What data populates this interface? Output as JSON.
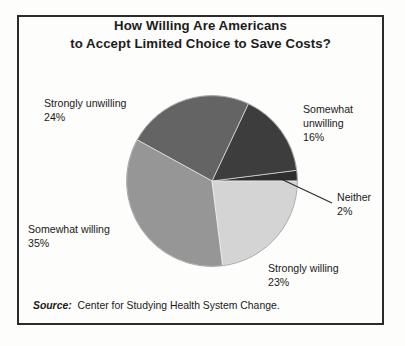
{
  "chart_data": {
    "type": "pie",
    "title": "How Willing Are Americans to Accept Limited Choice to Save Costs?",
    "title_lines": [
      "How Willing Are Americans",
      "to Accept Limited Choice to Save Costs?"
    ],
    "categories": [
      "Neither",
      "Somewhat unwilling",
      "Strongly unwilling",
      "Somewhat willing",
      "Strongly willing"
    ],
    "values": [
      2,
      16,
      24,
      35,
      23
    ],
    "value_labels": [
      "2%",
      "16%",
      "24%",
      "35%",
      "23%"
    ],
    "unit": "%",
    "colors": [
      "#2f2f2f",
      "#3d3d3d",
      "#646464",
      "#969696",
      "#d4d4d4"
    ],
    "legend_position": "callout-labels",
    "grid": false,
    "xlabel": "",
    "ylabel": "",
    "start_angle_deg": 0,
    "direction": "counterclockwise",
    "slices": [
      {
        "name": "Neither",
        "value": 2,
        "label": "Neither",
        "value_label": "2%",
        "color": "#2f2f2f",
        "start_deg": 0.0,
        "end_deg": 7.2
      },
      {
        "name": "Somewhat unwilling",
        "value": 16,
        "label": "Somewhat unwilling",
        "value_label": "16%",
        "color": "#3d3d3d",
        "start_deg": 7.2,
        "end_deg": 64.8
      },
      {
        "name": "Strongly unwilling",
        "value": 24,
        "label": "Strongly unwilling",
        "value_label": "24%",
        "color": "#646464",
        "start_deg": 64.8,
        "end_deg": 151.2
      },
      {
        "name": "Somewhat willing",
        "value": 35,
        "label": "Somewhat willing",
        "value_label": "35%",
        "color": "#969696",
        "start_deg": 151.2,
        "end_deg": 277.2
      },
      {
        "name": "Strongly willing",
        "value": 23,
        "label": "Strongly willing",
        "value_label": "23%",
        "color": "#d4d4d4",
        "start_deg": 277.2,
        "end_deg": 360.0
      }
    ]
  },
  "labels": {
    "strongly_unwilling": {
      "name": "Strongly unwilling",
      "value": "24%"
    },
    "somewhat_unwilling": {
      "name_line1": "Somewhat",
      "name_line2": "unwilling",
      "value": "16%"
    },
    "neither": {
      "name": "Neither",
      "value": "2%"
    },
    "strongly_willing": {
      "name": "Strongly willing",
      "value": "23%"
    },
    "somewhat_willing": {
      "name": "Somewhat willing",
      "value": "35%"
    }
  },
  "source": {
    "key": "Source:",
    "value": "Center for Studying Health System Change."
  },
  "style": {
    "frame_color": "#2b2b2b",
    "text_color": "#1a1a1a",
    "background": "#fdfdfc"
  }
}
